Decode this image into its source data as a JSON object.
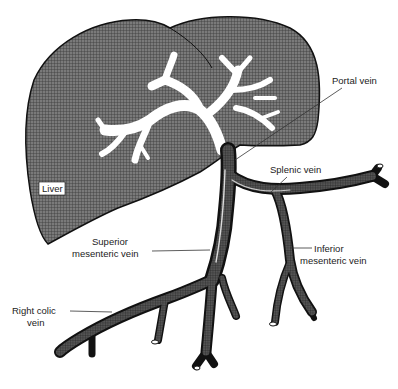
{
  "diagram": {
    "colors": {
      "liver_fill": "#6e6e6e",
      "vein_fill": "#3a3a3a",
      "vein_outline": "#111111",
      "portal_branches": "#ffffff",
      "background": "#ffffff"
    },
    "labels": {
      "liver": "Liver",
      "portal_vein": "Portal vein",
      "splenic_vein": "Splenic vein",
      "superior_mesenteric_1": "Superior",
      "superior_mesenteric_2": "mesenteric vein",
      "inferior_mesenteric_1": "Inferior",
      "inferior_mesenteric_2": "mesenteric vein",
      "right_colic_1": "Right colic",
      "right_colic_2": "vein"
    }
  }
}
